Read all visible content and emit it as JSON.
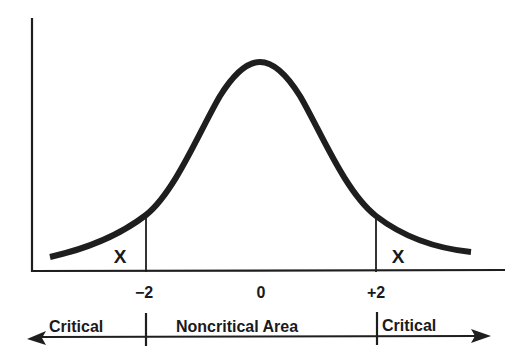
{
  "diagram": {
    "type": "normal-distribution",
    "curve_color": "#1e1e1e",
    "ticks": [
      {
        "label": "−2",
        "x": 146
      },
      {
        "label": "0",
        "x": 260
      },
      {
        "label": "+2",
        "x": 376
      }
    ],
    "tail_markers": {
      "left": "X",
      "right": "X"
    },
    "regions": {
      "left": "Critical",
      "middle": "Noncritical Area",
      "right": "Critical"
    }
  }
}
